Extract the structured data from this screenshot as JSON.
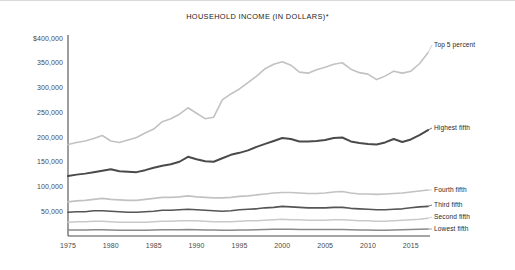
{
  "chart_data": {
    "type": "line",
    "title": "HOUSEHOLD INCOME (IN DOLLARS)*",
    "xlabel": "",
    "ylabel": "",
    "xlim": [
      1975,
      2017
    ],
    "ylim": [
      0,
      400000
    ],
    "grid": false,
    "legend_position": "right-inline-labels",
    "ytick_labels": [
      "$400,000",
      "350,000",
      "300,000",
      "250,000",
      "200,000",
      "150,000",
      "100,000",
      "50,000"
    ],
    "ytick_values": [
      400000,
      350000,
      300000,
      250000,
      200000,
      150000,
      100000,
      50000
    ],
    "xtick_labels": [
      "1975",
      "1980",
      "1985",
      "1990",
      "1995",
      "2000",
      "2005",
      "2010",
      "2015"
    ],
    "xtick_values": [
      1975,
      1980,
      1985,
      1990,
      1995,
      2000,
      2005,
      2010,
      2015
    ],
    "x": [
      1975,
      1976,
      1977,
      1978,
      1979,
      1980,
      1981,
      1982,
      1983,
      1984,
      1985,
      1986,
      1987,
      1988,
      1989,
      1990,
      1991,
      1992,
      1993,
      1994,
      1995,
      1996,
      1997,
      1998,
      1999,
      2000,
      2001,
      2002,
      2003,
      2004,
      2005,
      2006,
      2007,
      2008,
      2009,
      2010,
      2011,
      2012,
      2013,
      2014,
      2015,
      2016,
      2017
    ],
    "series": [
      {
        "name": "Top 5 percent",
        "color": "#c2c2c2",
        "width": 1.6,
        "values": [
          185000,
          189000,
          192000,
          197000,
          203000,
          192000,
          189000,
          194000,
          199000,
          208000,
          216000,
          231000,
          237000,
          246000,
          259000,
          248000,
          237000,
          240000,
          275000,
          287000,
          297000,
          310000,
          323000,
          338000,
          347000,
          352000,
          345000,
          331000,
          329000,
          336000,
          341000,
          347000,
          350000,
          337000,
          330000,
          327000,
          316000,
          323000,
          333000,
          329000,
          333000,
          348000,
          370000
        ]
      },
      {
        "name": "Highest fifth",
        "color": "#4a4a4a",
        "width": 2.0,
        "values": [
          121000,
          124000,
          126000,
          129000,
          132000,
          135000,
          131000,
          130000,
          129000,
          133000,
          138000,
          142000,
          145000,
          150000,
          160000,
          155000,
          151000,
          150000,
          157000,
          164000,
          168000,
          173000,
          180000,
          186000,
          192000,
          198000,
          196000,
          191000,
          191000,
          192000,
          194000,
          198000,
          199000,
          191000,
          188000,
          186000,
          185000,
          189000,
          196000,
          190000,
          195000,
          204000,
          214000
        ]
      },
      {
        "name": "Fourth fifth",
        "color": "#c2c2c2",
        "width": 1.6,
        "values": [
          69000,
          71000,
          72000,
          74000,
          76000,
          74000,
          73000,
          72000,
          72000,
          74000,
          76000,
          78000,
          78000,
          79000,
          81000,
          79000,
          78000,
          77000,
          77000,
          78000,
          80000,
          81000,
          83000,
          85000,
          87000,
          88000,
          88000,
          87000,
          86000,
          86000,
          87000,
          89000,
          90000,
          87000,
          85000,
          85000,
          84000,
          85000,
          86000,
          87000,
          89000,
          91000,
          93000
        ]
      },
      {
        "name": "Third fifth",
        "color": "#555555",
        "width": 1.7,
        "values": [
          48000,
          49000,
          49000,
          51000,
          51000,
          50000,
          49000,
          48000,
          48000,
          49000,
          50000,
          52000,
          52000,
          53000,
          54000,
          53000,
          52000,
          51000,
          50000,
          51000,
          53000,
          54000,
          55000,
          57000,
          58000,
          60000,
          59000,
          58000,
          57000,
          57000,
          57000,
          58000,
          58000,
          56000,
          55000,
          54000,
          53000,
          53000,
          54000,
          55000,
          57000,
          59000,
          60000
        ]
      },
      {
        "name": "Second fifth",
        "color": "#c9c9c9",
        "width": 1.5,
        "values": [
          28000,
          29000,
          29000,
          30000,
          30000,
          29000,
          28000,
          28000,
          28000,
          28000,
          29000,
          30000,
          30000,
          31000,
          31000,
          31000,
          30000,
          29000,
          29000,
          29000,
          30000,
          31000,
          31000,
          32000,
          33000,
          34000,
          33000,
          33000,
          32000,
          32000,
          32000,
          33000,
          33000,
          32000,
          31000,
          31000,
          30000,
          30000,
          31000,
          32000,
          33000,
          34000,
          36000
        ]
      },
      {
        "name": "Lowest fifth",
        "color": "#8a8a8a",
        "width": 1.5,
        "values": [
          12000,
          12000,
          12000,
          12500,
          12500,
          12000,
          11500,
          11500,
          11500,
          11500,
          12000,
          12500,
          12500,
          12500,
          13000,
          12500,
          12000,
          12000,
          11500,
          11500,
          12000,
          12000,
          12500,
          13000,
          13500,
          13500,
          13500,
          13000,
          13000,
          13000,
          13000,
          13000,
          13000,
          12500,
          12000,
          12000,
          11500,
          11500,
          12000,
          12500,
          13000,
          13500,
          14000
        ]
      }
    ]
  }
}
